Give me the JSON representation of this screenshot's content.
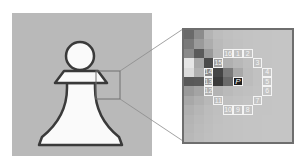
{
  "figure": {
    "center_label": "P",
    "ring_labels": [
      "1",
      "2",
      "3",
      "4",
      "5",
      "6",
      "7",
      "8",
      "9",
      "10",
      "11",
      "12",
      "13",
      "14",
      "15",
      "16"
    ]
  },
  "colors": {
    "panel_bg": "#b9b9b9",
    "zoom_bg": "#c2c2c2",
    "frame": "#6e6e6e",
    "ring_outline": "#f4f4f4",
    "center_fill": "#1e1e1e"
  }
}
